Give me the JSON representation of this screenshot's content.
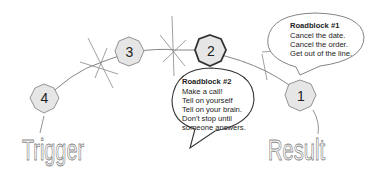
{
  "diagram": {
    "nodes": [
      {
        "id": "node-1",
        "label": "1"
      },
      {
        "id": "node-2",
        "label": "2"
      },
      {
        "id": "node-3",
        "label": "3"
      },
      {
        "id": "node-4",
        "label": "4"
      }
    ],
    "labels": {
      "start": "Trigger",
      "end": "Result"
    },
    "roadblock1": {
      "title": "Roadblock #1",
      "lines": [
        "Cancel the date.",
        "Cancel the order.",
        "Get out of the line."
      ]
    },
    "roadblock2": {
      "title": "Roadblock #2",
      "lines": [
        "Make a call!",
        "Tell on yourself",
        "Tell on your brain.",
        "Don't stop until",
        "someone answers."
      ]
    },
    "colors": {
      "octagon_fill": "#e6e6e6",
      "octagon_stroke": "#888888",
      "highlight_stroke": "#333333",
      "line": "#777777"
    }
  }
}
